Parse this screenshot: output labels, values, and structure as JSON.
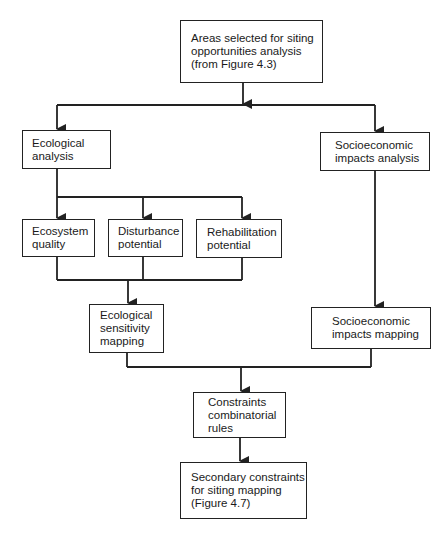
{
  "diagram": {
    "nodes": [
      {
        "id": "areas",
        "label": "Areas selected for siting\nopportunities analysis\n(from Figure 4.3)"
      },
      {
        "id": "eco_analysis",
        "label": "Ecological\nanalysis"
      },
      {
        "id": "socio_analysis",
        "label": "Socioeconomic\nimpacts analysis"
      },
      {
        "id": "eco_quality",
        "label": "Ecosystem\nquality"
      },
      {
        "id": "disturbance",
        "label": "Disturbance\npotential"
      },
      {
        "id": "rehab",
        "label": "Rehabilitation\npotential"
      },
      {
        "id": "eco_sensitivity",
        "label": "Ecological\nsensitivity\nmapping"
      },
      {
        "id": "socio_mapping",
        "label": "Socioeconomic\nimpacts mapping"
      },
      {
        "id": "combinatorial",
        "label": "Constraints\ncombinatorial\nrules"
      },
      {
        "id": "secondary",
        "label": "Secondary constraints\nfor siting mapping\n(Figure 4.7)"
      }
    ],
    "edges": [
      {
        "from": "areas",
        "to": "eco_analysis"
      },
      {
        "from": "areas",
        "to": "socio_analysis"
      },
      {
        "from": "eco_analysis",
        "to": "eco_quality"
      },
      {
        "from": "eco_analysis",
        "to": "disturbance"
      },
      {
        "from": "eco_analysis",
        "to": "rehab"
      },
      {
        "from": "eco_quality",
        "to": "eco_sensitivity"
      },
      {
        "from": "disturbance",
        "to": "eco_sensitivity"
      },
      {
        "from": "rehab",
        "to": "eco_sensitivity"
      },
      {
        "from": "socio_analysis",
        "to": "socio_mapping"
      },
      {
        "from": "eco_sensitivity",
        "to": "combinatorial"
      },
      {
        "from": "socio_mapping",
        "to": "combinatorial"
      },
      {
        "from": "combinatorial",
        "to": "secondary"
      }
    ],
    "colors": {
      "line": "#222222",
      "background": "#ffffff"
    }
  }
}
